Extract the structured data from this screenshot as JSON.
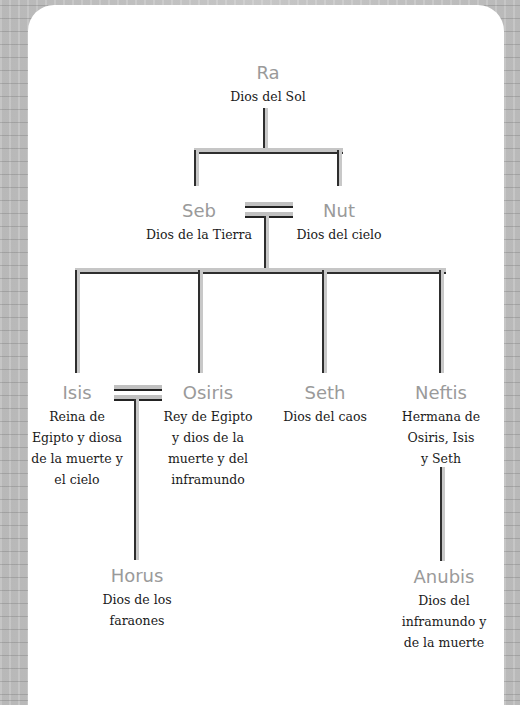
{
  "colors": {
    "name_text": "#9a9a9a",
    "desc_text": "#1a1a1a",
    "connector_fill": "#c6c6c6",
    "connector_edge": "#2e2e2e",
    "card_bg": "#ffffff",
    "page_bg": "#bdbdbd"
  },
  "generations": [
    {
      "level": 1,
      "members": [
        {
          "id": "ra",
          "name": "Ra",
          "description": "Dios del Sol"
        }
      ]
    },
    {
      "level": 2,
      "couple": true,
      "members": [
        {
          "id": "seb",
          "name": "Seb",
          "description": "Dios de la Tierra"
        },
        {
          "id": "nut",
          "name": "Nut",
          "description": "Dios del cielo"
        }
      ]
    },
    {
      "level": 3,
      "members": [
        {
          "id": "isis",
          "name": "Isis",
          "description": "Reina de Egipto y diosa de la muerte y el cielo"
        },
        {
          "id": "osiris",
          "name": "Osiris",
          "description": "Rey de Egipto y dios de la muerte y del inframundo"
        },
        {
          "id": "seth",
          "name": "Seth",
          "description": "Dios del caos"
        },
        {
          "id": "neftis",
          "name": "Neftis",
          "description": "Hermana de Osiris, Isis y Seth"
        }
      ]
    },
    {
      "level": 4,
      "members": [
        {
          "id": "horus",
          "name": "Horus",
          "description": "Dios de los faraones",
          "parents": [
            "isis",
            "osiris"
          ]
        },
        {
          "id": "anubis",
          "name": "Anubis",
          "description": "Dios del inframundo y de la muerte",
          "parents": [
            "neftis"
          ]
        }
      ]
    }
  ],
  "nodes": {
    "ra": {
      "name": "Ra",
      "desc": "Dios del Sol"
    },
    "seb": {
      "name": "Seb",
      "desc": "Dios de la Tierra"
    },
    "nut": {
      "name": "Nut",
      "desc": "Dios del cielo"
    },
    "isis": {
      "name": "Isis",
      "desc_lines": [
        "Reina de",
        "Egipto y diosa",
        "de la muerte y",
        "el cielo"
      ]
    },
    "osiris": {
      "name": "Osiris",
      "desc_lines": [
        "Rey de Egipto",
        "y dios de la",
        "muerte y del",
        "inframundo"
      ]
    },
    "seth": {
      "name": "Seth",
      "desc": "Dios del caos"
    },
    "neftis": {
      "name": "Neftis",
      "desc_lines": [
        "Hermana de",
        "Osiris, Isis",
        "y Seth"
      ]
    },
    "horus": {
      "name": "Horus",
      "desc_lines": [
        "Dios de los",
        "faraones"
      ]
    },
    "anubis": {
      "name": "Anubis",
      "desc_lines": [
        "Dios del",
        "inframundo y",
        "de la muerte"
      ]
    }
  }
}
